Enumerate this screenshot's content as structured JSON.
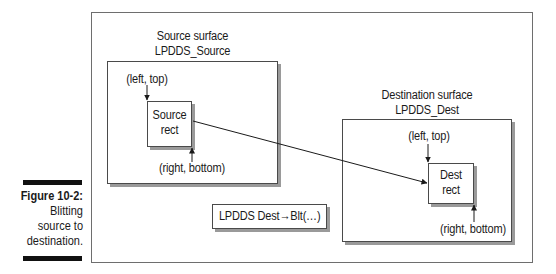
{
  "figure": {
    "number_label": "Figure 10-2:",
    "caption_lines": [
      "Blitting",
      "source to",
      "destination."
    ]
  },
  "source_surface": {
    "title": "Source surface",
    "name": "LPDDS_Source",
    "top_left_label": "(left, top)",
    "bottom_right_label": "(right, bottom)",
    "rect_lines": [
      "Source",
      "rect"
    ]
  },
  "dest_surface": {
    "title": "Destination surface",
    "name": "LPDDS_Dest",
    "top_left_label": "(left, top)",
    "bottom_right_label": "(right, bottom)",
    "rect_lines": [
      "Dest",
      "rect"
    ]
  },
  "call_box": {
    "label": "LPDDS Dest→Blt(…)"
  },
  "colors": {
    "frame": "#6e6e6e",
    "box_border": "#4a4a4a",
    "shadow": "#9a9a9a",
    "caption_bar": "#111111"
  }
}
